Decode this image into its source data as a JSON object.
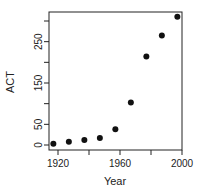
{
  "chart_data": {
    "type": "scatter",
    "title": "",
    "xlabel": "Year",
    "ylabel": "ACT",
    "x": [
      1917,
      1927,
      1937,
      1947,
      1957,
      1967,
      1977,
      1987,
      1997
    ],
    "y": [
      3,
      8,
      12,
      17,
      38,
      103,
      214,
      265,
      310
    ],
    "xlim": [
      1914,
      2000
    ],
    "ylim": [
      -12,
      322
    ],
    "xticks": [
      1920,
      1940,
      1960,
      1980,
      2000
    ],
    "xtick_labels": [
      "1920",
      "",
      "1960",
      "",
      "2000"
    ],
    "yticks": [
      0,
      50,
      100,
      150,
      200,
      250,
      300
    ],
    "ytick_labels": [
      "0",
      "50",
      "",
      "150",
      "",
      "250",
      ""
    ],
    "grid": false,
    "legend": null,
    "colors": {
      "points": "#111111",
      "axes": "#222222"
    }
  }
}
